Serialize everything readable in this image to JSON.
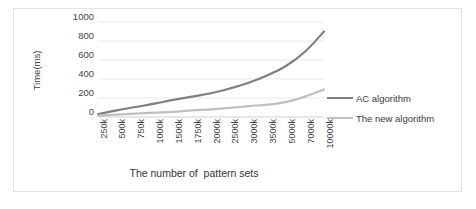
{
  "chart_data": {
    "type": "line",
    "title": "",
    "xlabel": "The number of  pattern sets",
    "ylabel": "Time(ms)",
    "categories": [
      "250k",
      "500k",
      "750k",
      "1000k",
      "1500k",
      "1750k",
      "2000k",
      "2500k",
      "3000k",
      "3500k",
      "5000k",
      "7000k",
      "10000k"
    ],
    "ylim": [
      0,
      1000
    ],
    "yticks": [
      1000,
      800,
      600,
      400,
      200,
      0
    ],
    "grid": true,
    "legend_position": "right",
    "series": [
      {
        "name": "AC algorithm",
        "color": "#7f7f7f",
        "values": [
          30,
          70,
          105,
          140,
          180,
          215,
          250,
          300,
          360,
          440,
          540,
          690,
          900
        ]
      },
      {
        "name": "The new algorithm",
        "color": "#bfbfbf",
        "values": [
          15,
          25,
          35,
          45,
          55,
          70,
          80,
          95,
          115,
          130,
          160,
          215,
          290
        ]
      }
    ]
  },
  "legend": {
    "items": [
      {
        "label": "AC algorithm",
        "color": "#7f7f7f"
      },
      {
        "label": "The new algorithm",
        "color": "#bfbfbf"
      }
    ]
  }
}
